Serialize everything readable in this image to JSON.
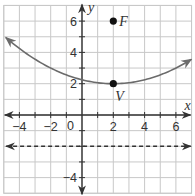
{
  "chart_data": {
    "type": "line",
    "title": "",
    "xlabel": "x",
    "ylabel": "y",
    "xlim": [
      -5,
      7
    ],
    "ylim": [
      -5,
      7
    ],
    "grid": true,
    "grid_step": 1,
    "x_ticks": [
      -4,
      -2,
      0,
      2,
      4,
      6
    ],
    "x_tick_labels": [
      "−4",
      "−2",
      "0",
      "2",
      "4",
      "6"
    ],
    "y_ticks": [
      -4,
      2,
      4,
      6
    ],
    "y_tick_labels": [
      "−4",
      "2",
      "4",
      "6"
    ],
    "origin_label": "0",
    "series": [
      {
        "name": "parabola",
        "equation": "y = (1/16)(x - 2)^2 + 2",
        "vertex": [
          2,
          2
        ],
        "a": 0.0625,
        "x_range": [
          -4.87,
          6.99
        ],
        "style": "solid",
        "color": "#6b6b6b",
        "arrows": "both"
      },
      {
        "name": "directrix",
        "equation": "y = -2",
        "y": -2,
        "x_range": [
          -4.85,
          6.95
        ],
        "style": "dashed",
        "color": "#333333",
        "arrows": "both"
      }
    ],
    "points": [
      {
        "label": "F",
        "x": 2,
        "y": 6
      },
      {
        "label": "V",
        "x": 2,
        "y": 2
      }
    ],
    "colors": {
      "grid": "#c8c8c8",
      "axes": "#333333",
      "curve": "#6b6b6b",
      "points": "#111111"
    }
  }
}
